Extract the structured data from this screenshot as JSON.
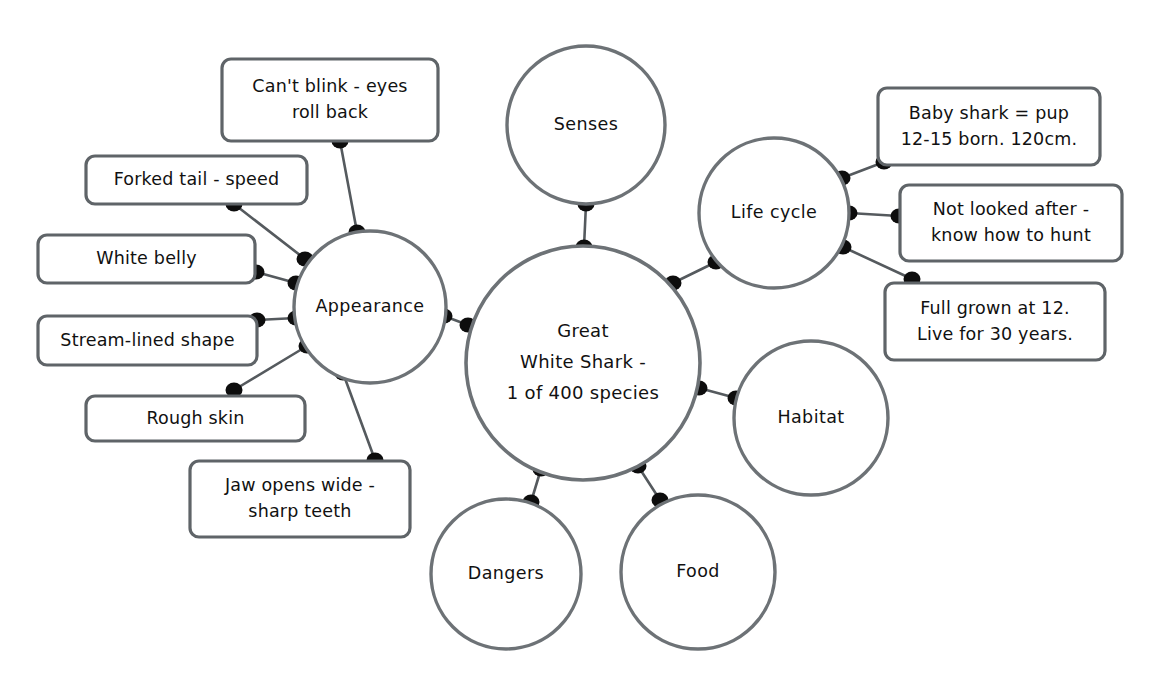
{
  "diagram": {
    "type": "mind-map",
    "canvas": {
      "width": 1155,
      "height": 693,
      "background": "#ffffff"
    },
    "style": {
      "stroke_color": "#6d7276",
      "line_color": "#555a5e",
      "dot_color": "#0d0d0d",
      "text_color": "#111111",
      "shape_fill": "#ffffff"
    }
  },
  "central": {
    "id": "great-white-shark",
    "lines": [
      "Great",
      "White Shark -",
      "1 of 400 species"
    ],
    "cx": 583,
    "cy": 363,
    "r": 117
  },
  "branches": [
    {
      "id": "appearance",
      "label": "Appearance",
      "cx": 370,
      "cy": 307,
      "r": 76
    },
    {
      "id": "senses",
      "label": "Senses",
      "cx": 586,
      "cy": 125,
      "r": 79
    },
    {
      "id": "life-cycle",
      "label": "Life cycle",
      "cx": 774,
      "cy": 213,
      "r": 75
    },
    {
      "id": "habitat",
      "label": "Habitat",
      "cx": 811,
      "cy": 418,
      "r": 77
    },
    {
      "id": "food",
      "label": "Food",
      "cx": 698,
      "cy": 572,
      "r": 77
    },
    {
      "id": "dangers",
      "label": "Dangers",
      "cx": 506,
      "cy": 574,
      "r": 75
    }
  ],
  "notes": [
    {
      "id": "cant-blink",
      "parent": "appearance",
      "lines": [
        "Can't blink - eyes",
        "roll back"
      ],
      "x": 222,
      "y": 59,
      "w": 216,
      "h": 82
    },
    {
      "id": "forked-tail",
      "parent": "appearance",
      "lines": [
        "Forked tail - speed"
      ],
      "x": 86,
      "y": 156,
      "w": 221,
      "h": 48
    },
    {
      "id": "white-belly",
      "parent": "appearance",
      "lines": [
        "White belly"
      ],
      "x": 38,
      "y": 235,
      "w": 217,
      "h": 48
    },
    {
      "id": "stream-lined-shape",
      "parent": "appearance",
      "lines": [
        "Stream-lined shape"
      ],
      "x": 38,
      "y": 316,
      "w": 219,
      "h": 49
    },
    {
      "id": "rough-skin",
      "parent": "appearance",
      "lines": [
        "Rough skin"
      ],
      "x": 86,
      "y": 396,
      "w": 219,
      "h": 45
    },
    {
      "id": "jaw-opens-wide",
      "parent": "appearance",
      "lines": [
        "Jaw opens wide -",
        "sharp teeth"
      ],
      "x": 190,
      "y": 461,
      "w": 220,
      "h": 76
    },
    {
      "id": "baby-shark-pup",
      "parent": "life-cycle",
      "lines": [
        "Baby shark = pup",
        "12-15 born. 120cm."
      ],
      "x": 878,
      "y": 88,
      "w": 222,
      "h": 77
    },
    {
      "id": "not-looked-after",
      "parent": "life-cycle",
      "lines": [
        "Not looked after -",
        "know how to hunt"
      ],
      "x": 900,
      "y": 185,
      "w": 222,
      "h": 76
    },
    {
      "id": "full-grown-at-12",
      "parent": "life-cycle",
      "lines": [
        "Full grown at 12.",
        "Live for 30 years."
      ],
      "x": 885,
      "y": 283,
      "w": 220,
      "h": 77
    }
  ],
  "connections": [
    {
      "from": "great-white-shark",
      "to": "appearance",
      "x1": 468,
      "y1": 325,
      "x2": 444,
      "y2": 316
    },
    {
      "from": "great-white-shark",
      "to": "senses",
      "x1": 584,
      "y1": 247,
      "x2": 586,
      "y2": 204
    },
    {
      "from": "great-white-shark",
      "to": "life-cycle",
      "x1": 673,
      "y1": 283,
      "x2": 716,
      "y2": 262
    },
    {
      "from": "great-white-shark",
      "to": "habitat",
      "x1": 699,
      "y1": 388,
      "x2": 736,
      "y2": 398
    },
    {
      "from": "great-white-shark",
      "to": "food",
      "x1": 638,
      "y1": 466,
      "x2": 660,
      "y2": 500
    },
    {
      "from": "great-white-shark",
      "to": "dangers",
      "x1": 541,
      "y1": 469,
      "x2": 531,
      "y2": 502
    },
    {
      "from": "appearance",
      "to": "cant-blink",
      "x1": 357,
      "y1": 232,
      "x2": 340,
      "y2": 141
    },
    {
      "from": "appearance",
      "to": "forked-tail",
      "x1": 305,
      "y1": 259,
      "x2": 234,
      "y2": 204
    },
    {
      "from": "appearance",
      "to": "white-belly",
      "x1": 296,
      "y1": 283,
      "x2": 256,
      "y2": 272
    },
    {
      "from": "appearance",
      "to": "stream-lined-shape",
      "x1": 296,
      "y1": 318,
      "x2": 257,
      "y2": 320
    },
    {
      "from": "appearance",
      "to": "rough-skin",
      "x1": 307,
      "y1": 346,
      "x2": 234,
      "y2": 390
    },
    {
      "from": "appearance",
      "to": "jaw-opens-wide",
      "x1": 343,
      "y1": 373,
      "x2": 375,
      "y2": 460
    },
    {
      "from": "life-cycle",
      "to": "baby-shark-pup",
      "x1": 842,
      "y1": 178,
      "x2": 884,
      "y2": 162
    },
    {
      "from": "life-cycle",
      "to": "not-looked-after",
      "x1": 849,
      "y1": 213,
      "x2": 899,
      "y2": 216
    },
    {
      "from": "life-cycle",
      "to": "full-grown-at-12",
      "x1": 843,
      "y1": 247,
      "x2": 912,
      "y2": 279
    }
  ]
}
